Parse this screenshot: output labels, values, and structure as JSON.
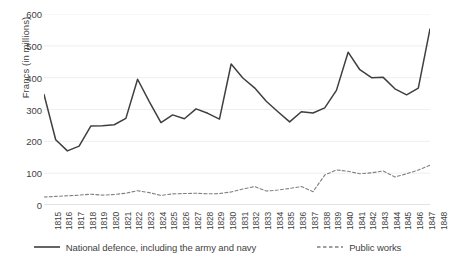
{
  "chart_data": {
    "type": "line",
    "title": "",
    "xlabel": "",
    "ylabel": "Francs (in millions)",
    "ylim": [
      0,
      600
    ],
    "ytick_labels": [
      "600",
      "500",
      "400",
      "300",
      "200",
      "100",
      "0"
    ],
    "ytick_values": [
      600,
      500,
      400,
      300,
      200,
      100,
      0
    ],
    "grid": true,
    "legend_position": "bottom",
    "categories": [
      "1815",
      "1816",
      "1817",
      "1818",
      "1819",
      "1820",
      "1821",
      "1822",
      "1823",
      "1824",
      "1825",
      "1826",
      "1827",
      "1828",
      "1829",
      "1830",
      "1831",
      "1832",
      "1833",
      "1834",
      "1835",
      "1836",
      "1837",
      "1838",
      "1839",
      "1840",
      "1841",
      "1842",
      "1843",
      "1844",
      "1845",
      "1846",
      "1847",
      "1848"
    ],
    "series": [
      {
        "name": "National defence, including the army and navy",
        "style": "solid",
        "color": "#3f3f3f",
        "values": [
          347,
          205,
          170,
          185,
          248,
          249,
          252,
          272,
          395,
          325,
          259,
          283,
          271,
          302,
          288,
          270,
          443,
          399,
          368,
          326,
          293,
          261,
          293,
          289,
          305,
          360,
          480,
          425,
          400,
          401,
          365,
          346,
          367,
          553
        ]
      },
      {
        "name": "Public works",
        "style": "dashed",
        "color": "#808080",
        "values": [
          25,
          27,
          29,
          31,
          34,
          31,
          33,
          37,
          45,
          39,
          30,
          35,
          36,
          37,
          35,
          36,
          41,
          50,
          58,
          44,
          47,
          52,
          58,
          42,
          94,
          110,
          106,
          98,
          101,
          107,
          88,
          98,
          110,
          125
        ]
      }
    ]
  },
  "legend": {
    "entries": [
      {
        "label": "National defence, including the army and navy"
      },
      {
        "label": "Public works"
      }
    ]
  }
}
